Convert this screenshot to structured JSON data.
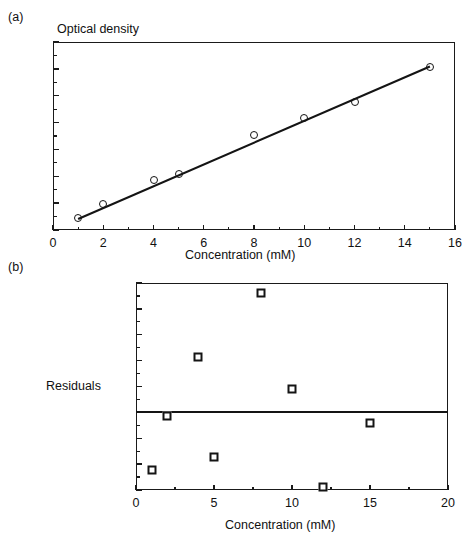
{
  "figure": {
    "panel_a_label": "(a)",
    "panel_b_label": "(b)"
  },
  "chart_data": [
    {
      "panel": "(a)",
      "type": "scatter",
      "title": "",
      "xlabel": "Concentration (mM)",
      "ylabel": "Optical density",
      "ylabel_position": "above-axis",
      "xlim": [
        0,
        16
      ],
      "ylim": [
        0,
        70
      ],
      "xticks": [
        0,
        2,
        4,
        6,
        8,
        10,
        12,
        14,
        16
      ],
      "xticklabels": [
        "0",
        "2",
        "4",
        "6",
        "8",
        "10",
        "12",
        "14",
        "16"
      ],
      "yticks": [
        0,
        10,
        20,
        30,
        40,
        50,
        60,
        70
      ],
      "yticklabels": [
        "0",
        "10",
        "20",
        "30",
        "40",
        "50",
        "60",
        "70"
      ],
      "grid": false,
      "legend": false,
      "marker": "open-circle",
      "x": [
        1,
        2,
        4,
        5,
        8,
        10,
        12,
        15
      ],
      "y": [
        4.5,
        9.6,
        18.7,
        21.0,
        35.5,
        41.6,
        47.8,
        60.8
      ],
      "fit_line": {
        "type": "linear-regression",
        "x0": 1,
        "y0": 4.1,
        "x1": 15,
        "y1": 60.9
      }
    },
    {
      "panel": "(b)",
      "type": "scatter",
      "title": "",
      "xlabel": "Concentration (mM)",
      "ylabel": "Residuals",
      "ylabel_position": "left-of-axis",
      "xlim": [
        0,
        20
      ],
      "ylim": [
        -1.5,
        2.5
      ],
      "xticks": [
        0,
        5,
        10,
        15,
        20
      ],
      "xticklabels": [
        "0",
        "5",
        "10",
        "15",
        "20"
      ],
      "yticks": [
        -1.5,
        -1,
        -0.5,
        0,
        0.5,
        1,
        1.5,
        2,
        2.5
      ],
      "yticklabels": [
        "-1.5",
        "-1",
        "-0.5",
        "0",
        "0.5",
        "1",
        "1.5",
        "2",
        "2.5"
      ],
      "grid": false,
      "legend": false,
      "marker": "open-square",
      "reference_line": 0,
      "x": [
        1,
        2,
        4,
        5,
        8,
        10,
        12,
        15
      ],
      "y": [
        -1.12,
        -0.07,
        1.07,
        -0.87,
        2.3,
        0.45,
        -1.45,
        -0.2
      ]
    }
  ]
}
